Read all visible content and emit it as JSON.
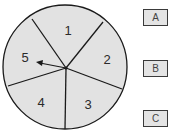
{
  "spinner": {
    "sections": [
      {
        "label": "1"
      },
      {
        "label": "2"
      },
      {
        "label": "3"
      },
      {
        "label": "4"
      },
      {
        "label": "5"
      }
    ],
    "arrow_points_to": "5",
    "fill_color": "#e2e2e2",
    "line_color": "#1a1a1a"
  },
  "options": [
    {
      "label": "A"
    },
    {
      "label": "B"
    },
    {
      "label": "C"
    }
  ]
}
